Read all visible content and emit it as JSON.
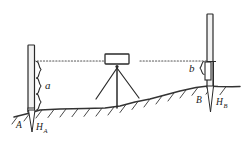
{
  "diagram": {
    "type": "surveying-leveling",
    "colors": {
      "line": "#2a2a2a",
      "ground": "#333333",
      "staff_fill": "#f2f2f2",
      "instrument_fill": "#ffffff",
      "background": "#ffffff"
    },
    "labels": {
      "backsight_reading": "a",
      "foresight_reading": "b",
      "point_a": "A",
      "point_b": "B",
      "elevation_a_base": "H",
      "elevation_a_sub": "A",
      "elevation_b_base": "H",
      "elevation_b_sub": "B"
    },
    "elements": {
      "left_staff": "leveling-staff-a",
      "right_staff": "leveling-staff-b",
      "instrument": "level-instrument",
      "tripod": "tripod",
      "sight_line": "line-of-sight",
      "ground": "ground-surface",
      "brace_a": "measurement-brace-a",
      "brace_b": "measurement-brace-b",
      "stake_a": "ground-stake-a",
      "stake_b": "ground-stake-b"
    }
  }
}
